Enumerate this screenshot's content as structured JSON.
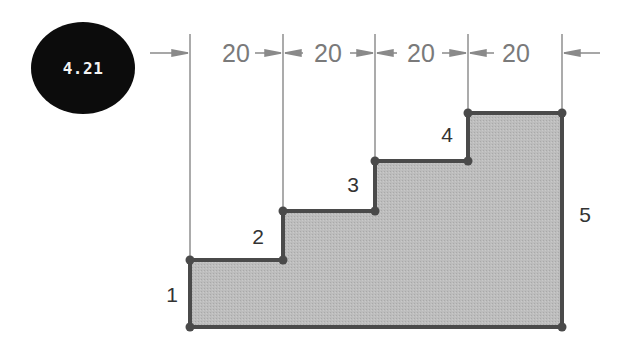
{
  "figure": {
    "number_badge": "4.21",
    "colors": {
      "badge_bg": "#0c0c0c",
      "badge_text": "#f4f4f4",
      "outline": "#4a4a4a",
      "fill": "#b9b9b9",
      "dimension": "#8a8a8a",
      "label": "#333333"
    }
  },
  "dimensions": [
    {
      "label": "20",
      "x": 236
    },
    {
      "label": "20",
      "x": 328
    },
    {
      "label": "20",
      "x": 421
    },
    {
      "label": "20",
      "x": 516
    }
  ],
  "extension_lines_x": [
    190,
    283,
    375,
    468,
    562
  ],
  "shape": {
    "type": "stepped-profile",
    "vertices": [
      [
        190,
        260
      ],
      [
        283,
        260
      ],
      [
        283,
        211
      ],
      [
        375,
        211
      ],
      [
        375,
        161
      ],
      [
        468,
        161
      ],
      [
        468,
        113
      ],
      [
        562,
        113
      ],
      [
        562,
        327
      ],
      [
        190,
        327
      ]
    ]
  },
  "segment_labels": [
    {
      "label": "1",
      "x": 172,
      "y": 302
    },
    {
      "label": "2",
      "x": 258,
      "y": 244
    },
    {
      "label": "3",
      "x": 353,
      "y": 192
    },
    {
      "label": "4",
      "x": 447,
      "y": 142
    },
    {
      "label": "5",
      "x": 585,
      "y": 222
    }
  ]
}
